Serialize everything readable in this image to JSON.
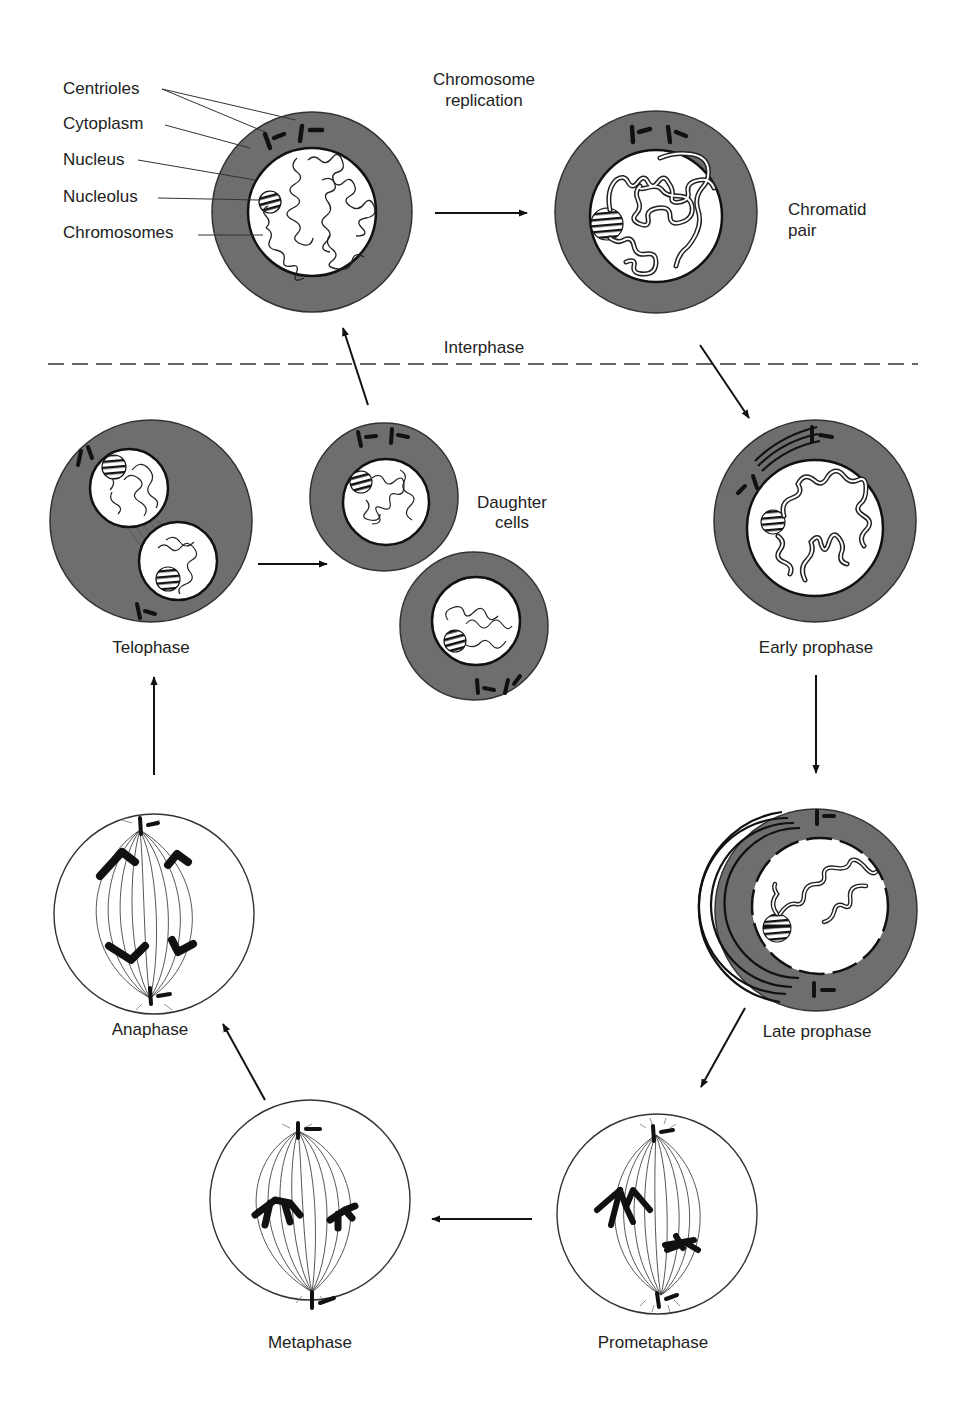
{
  "diagram": {
    "colors": {
      "cytoplasm": "#6e6e6e",
      "nucleus": "#ffffff",
      "outline": "#1a1a1a",
      "text": "#222222",
      "background": "#ffffff"
    },
    "legend_labels": {
      "centrioles": "Centrioles",
      "cytoplasm": "Cytoplasm",
      "nucleus": "Nucleus",
      "nucleolus": "Nucleolus",
      "chromosomes": "Chromosomes"
    },
    "annotations": {
      "chromosome_replication_line1": "Chromosome",
      "chromosome_replication_line2": "replication",
      "chromatid_pair_line1": "Chromatid",
      "chromatid_pair_line2": "pair",
      "interphase": "Interphase",
      "daughter_cells_line1": "Daughter",
      "daughter_cells_line2": "cells"
    },
    "stages": [
      {
        "id": "interphase-g1",
        "label": "",
        "cx": 312,
        "cy": 212,
        "r": 100
      },
      {
        "id": "interphase-replicated",
        "label": "",
        "cx": 656,
        "cy": 212,
        "r": 101
      },
      {
        "id": "early-prophase",
        "label": "Early prophase",
        "cx": 815,
        "cy": 521,
        "r": 101
      },
      {
        "id": "late-prophase",
        "label": "Late prophase",
        "cx": 816,
        "cy": 910,
        "r": 101
      },
      {
        "id": "prometaphase",
        "label": "Prometaphase",
        "cx": 657,
        "cy": 1214,
        "r": 100
      },
      {
        "id": "metaphase",
        "label": "Metaphase",
        "cx": 310,
        "cy": 1200,
        "r": 100
      },
      {
        "id": "anaphase",
        "label": "Anaphase",
        "cx": 154,
        "cy": 914,
        "r": 100
      },
      {
        "id": "telophase",
        "label": "Telophase",
        "cx": 151,
        "cy": 521,
        "r": 101
      },
      {
        "id": "daughter-cell-1",
        "label": "",
        "cx": 384,
        "cy": 497,
        "r": 74
      },
      {
        "id": "daughter-cell-2",
        "label": "",
        "cx": 474,
        "cy": 626,
        "r": 74
      }
    ],
    "flow": [
      "interphase-g1 -> interphase-replicated",
      "interphase-replicated -> early-prophase",
      "early-prophase -> late-prophase",
      "late-prophase -> prometaphase",
      "prometaphase -> metaphase",
      "metaphase -> anaphase",
      "anaphase -> telophase",
      "telophase -> daughter-cells",
      "daughter-cells -> interphase-g1"
    ]
  }
}
